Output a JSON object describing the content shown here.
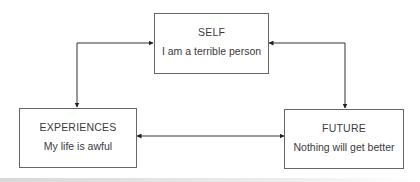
{
  "diagram": {
    "type": "cognitive-triad",
    "nodes": [
      {
        "id": "self",
        "title": "SELF",
        "text": "I am a terrible person"
      },
      {
        "id": "experiences",
        "title": "EXPERIENCES",
        "text": "My life is awful"
      },
      {
        "id": "future",
        "title": "FUTURE",
        "text": "Nothing will get better"
      }
    ],
    "edges": [
      {
        "from": "self",
        "to": "experiences",
        "bidirectional": true
      },
      {
        "from": "self",
        "to": "future",
        "bidirectional": true
      },
      {
        "from": "experiences",
        "to": "future",
        "bidirectional": true
      }
    ]
  },
  "colors": {
    "line": "#333333",
    "border": "#666666",
    "text": "#3a3a3a"
  }
}
